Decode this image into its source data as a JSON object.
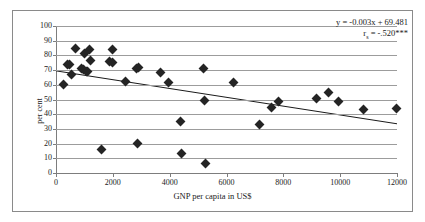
{
  "chart_data": {
    "type": "scatter",
    "title": "",
    "xlabel": "GNP per capita in US$",
    "ylabel": "per cent",
    "xlim": [
      0,
      12000
    ],
    "ylim": [
      0,
      100
    ],
    "xticks": [
      0,
      2000,
      4000,
      6000,
      8000,
      10000,
      12000
    ],
    "yticks": [
      0,
      10,
      20,
      30,
      40,
      50,
      60,
      70,
      80,
      90,
      100
    ],
    "grid": "horizontal",
    "legend": "none",
    "marker": "diamond",
    "marker_color": "#242424",
    "points": [
      {
        "x": 250,
        "y": 60.3
      },
      {
        "x": 420,
        "y": 74.0
      },
      {
        "x": 470,
        "y": 73.6
      },
      {
        "x": 560,
        "y": 66.7
      },
      {
        "x": 700,
        "y": 85.0
      },
      {
        "x": 880,
        "y": 71.0
      },
      {
        "x": 960,
        "y": 70.4
      },
      {
        "x": 1020,
        "y": 81.2
      },
      {
        "x": 1060,
        "y": 69.2
      },
      {
        "x": 1120,
        "y": 68.8
      },
      {
        "x": 1180,
        "y": 84.3
      },
      {
        "x": 1210,
        "y": 76.4
      },
      {
        "x": 1600,
        "y": 16.0
      },
      {
        "x": 1900,
        "y": 75.7
      },
      {
        "x": 1980,
        "y": 75.4
      },
      {
        "x": 2000,
        "y": 84.2
      },
      {
        "x": 2430,
        "y": 62.2
      },
      {
        "x": 2830,
        "y": 71.4
      },
      {
        "x": 2900,
        "y": 71.8
      },
      {
        "x": 2880,
        "y": 20.1
      },
      {
        "x": 3680,
        "y": 68.4
      },
      {
        "x": 3960,
        "y": 61.4
      },
      {
        "x": 4380,
        "y": 34.7
      },
      {
        "x": 4420,
        "y": 13.0
      },
      {
        "x": 5200,
        "y": 70.9
      },
      {
        "x": 5230,
        "y": 49.3
      },
      {
        "x": 5250,
        "y": 6.7
      },
      {
        "x": 6250,
        "y": 61.6
      },
      {
        "x": 7150,
        "y": 32.8
      },
      {
        "x": 7600,
        "y": 44.5
      },
      {
        "x": 7830,
        "y": 48.7
      },
      {
        "x": 9180,
        "y": 50.5
      },
      {
        "x": 9580,
        "y": 54.9
      },
      {
        "x": 9950,
        "y": 48.7
      },
      {
        "x": 10820,
        "y": 42.9
      },
      {
        "x": 11980,
        "y": 44.2
      }
    ],
    "trendline": {
      "slope": -0.003,
      "intercept": 69.481,
      "x_start": 0,
      "x_end": 12000,
      "y_start": 69.481,
      "y_end": 33.481,
      "color": "#1a1a1a"
    },
    "annotation": {
      "equation": "y = -0.003x + 69.481",
      "correlation_prefix": "r",
      "correlation_subscript": "s",
      "correlation_value": " = -.520***"
    }
  }
}
